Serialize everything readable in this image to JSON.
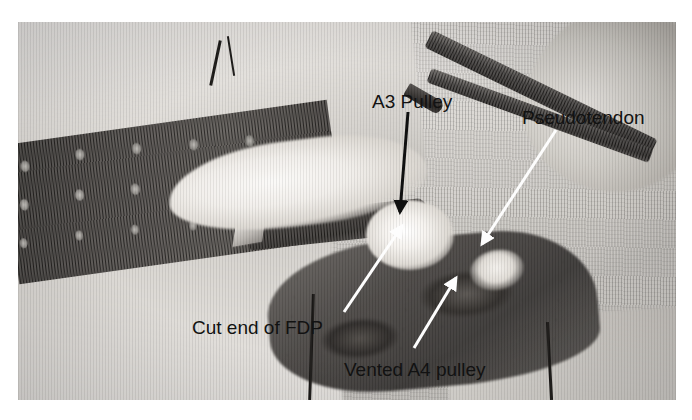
{
  "figure": {
    "type": "annotated-surgical-photograph",
    "modality": "grayscale clinical photograph",
    "plate": {
      "left": 18,
      "top": 22,
      "width": 658,
      "height": 378,
      "border_color": "#ffffff"
    }
  },
  "annotations": [
    {
      "id": "a3-pulley",
      "label": "A3 Pulley",
      "text_color": "#121212",
      "leader": {
        "style": "arrow",
        "color": "#101010",
        "from": {
          "x": 408,
          "y": 112
        },
        "to": {
          "x": 400,
          "y": 212
        }
      }
    },
    {
      "id": "pseudotendon",
      "label": "Pseudotendon",
      "text_color": "#121212",
      "leader": {
        "style": "arrow",
        "color": "#fdfdfd",
        "from": {
          "x": 556,
          "y": 130
        },
        "to": {
          "x": 482,
          "y": 244
        }
      }
    },
    {
      "id": "cut-end-of-fdp",
      "label": "Cut end of FDP",
      "text_color": "#121212",
      "leader": {
        "style": "arrow",
        "color": "#fdfdfd",
        "from": {
          "x": 344,
          "y": 312
        },
        "to": {
          "x": 402,
          "y": 226
        }
      }
    },
    {
      "id": "vented-a4-pulley",
      "label": "Vented A4 pulley",
      "text_color": "#121212",
      "leader": {
        "style": "arrow",
        "color": "#fdfdfd",
        "from": {
          "x": 414,
          "y": 348
        },
        "to": {
          "x": 456,
          "y": 278
        }
      }
    }
  ],
  "scene_elements": [
    {
      "name": "surgical-drape-gauze",
      "description": "pale woven gauze drape filling the upper-left and lower-left field"
    },
    {
      "name": "perforated-retractor",
      "description": "dark perforated metal retractor plate across the left of the field"
    },
    {
      "name": "flexor-tendon",
      "description": "bright white glistening flexor tendon running across the centre"
    },
    {
      "name": "scalpel-blade",
      "description": "dark instrument blade lying beneath the tendon"
    },
    {
      "name": "forceps",
      "description": "dark toothed forceps entering from the upper right"
    },
    {
      "name": "wound-bed",
      "description": "dark open wound bed to the right of the tendon"
    },
    {
      "name": "finger-thumb",
      "description": "pale digit at the far right of the frame"
    },
    {
      "name": "suture-threads",
      "description": "fine dark suture strands at the top and bottom of the wound"
    }
  ]
}
